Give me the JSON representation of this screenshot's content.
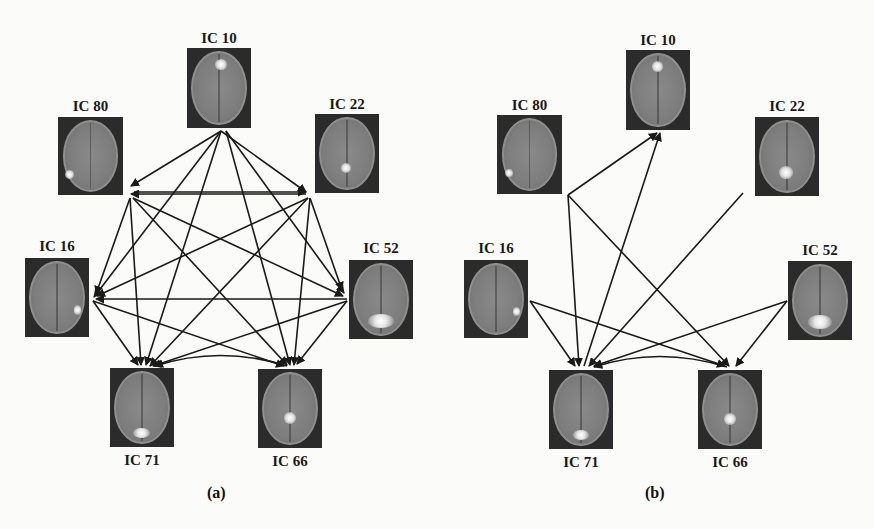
{
  "figure": {
    "panels": [
      {
        "id": "a",
        "caption": "(a)",
        "nodes": [
          {
            "id": "IC10",
            "label": "IC 10",
            "spot": "frontal-medial"
          },
          {
            "id": "IC80",
            "label": "IC 80",
            "spot": "left-posterior-lateral"
          },
          {
            "id": "IC22",
            "label": "IC 22",
            "spot": "posterior-medial"
          },
          {
            "id": "IC16",
            "label": "IC 16",
            "spot": "right-posterior-lateral"
          },
          {
            "id": "IC52",
            "label": "IC 52",
            "spot": "occipital"
          },
          {
            "id": "IC71",
            "label": "IC 71",
            "spot": "occipital-medial"
          },
          {
            "id": "IC66",
            "label": "IC 66",
            "spot": "posterior-cingulate"
          }
        ],
        "edges": [
          {
            "from": "IC10",
            "to": "IC80"
          },
          {
            "from": "IC10",
            "to": "IC22"
          },
          {
            "from": "IC10",
            "to": "IC16"
          },
          {
            "from": "IC10",
            "to": "IC52"
          },
          {
            "from": "IC10",
            "to": "IC71"
          },
          {
            "from": "IC10",
            "to": "IC66"
          },
          {
            "from": "IC22",
            "to": "IC80"
          },
          {
            "from": "IC80",
            "to": "IC22"
          },
          {
            "from": "IC80",
            "to": "IC16"
          },
          {
            "from": "IC80",
            "to": "IC52"
          },
          {
            "from": "IC80",
            "to": "IC71"
          },
          {
            "from": "IC80",
            "to": "IC66"
          },
          {
            "from": "IC22",
            "to": "IC16"
          },
          {
            "from": "IC22",
            "to": "IC52"
          },
          {
            "from": "IC22",
            "to": "IC71"
          },
          {
            "from": "IC22",
            "to": "IC66"
          },
          {
            "from": "IC52",
            "to": "IC16"
          },
          {
            "from": "IC16",
            "to": "IC71"
          },
          {
            "from": "IC16",
            "to": "IC66"
          },
          {
            "from": "IC52",
            "to": "IC71"
          },
          {
            "from": "IC52",
            "to": "IC66"
          },
          {
            "from": "IC66",
            "to": "IC71",
            "curved": true
          }
        ]
      },
      {
        "id": "b",
        "caption": "(b)",
        "nodes": [
          {
            "id": "IC10",
            "label": "IC 10",
            "spot": "frontal-medial"
          },
          {
            "id": "IC80",
            "label": "IC 80",
            "spot": "left-posterior-lateral"
          },
          {
            "id": "IC22",
            "label": "IC 22",
            "spot": "posterior-medial"
          },
          {
            "id": "IC16",
            "label": "IC 16",
            "spot": "right-posterior-lateral"
          },
          {
            "id": "IC52",
            "label": "IC 52",
            "spot": "occipital"
          },
          {
            "id": "IC71",
            "label": "IC 71",
            "spot": "occipital-medial"
          },
          {
            "id": "IC66",
            "label": "IC 66",
            "spot": "posterior-cingulate"
          }
        ],
        "edges": [
          {
            "from": "IC80",
            "to": "IC10"
          },
          {
            "from": "IC80",
            "to": "IC71"
          },
          {
            "from": "IC80",
            "to": "IC66"
          },
          {
            "from": "IC71",
            "to": "IC10"
          },
          {
            "from": "IC22",
            "to": "IC71"
          },
          {
            "from": "IC16",
            "to": "IC71"
          },
          {
            "from": "IC16",
            "to": "IC66"
          },
          {
            "from": "IC52",
            "to": "IC71"
          },
          {
            "from": "IC52",
            "to": "IC66"
          },
          {
            "from": "IC66",
            "to": "IC71",
            "curved": true
          }
        ]
      }
    ]
  },
  "colors": {
    "background": "#fbfbfa",
    "edge": "#1a1a1a",
    "scan_background": "#2b2b2b",
    "brain_tissue": "#808080",
    "activation": "#ffffff"
  }
}
